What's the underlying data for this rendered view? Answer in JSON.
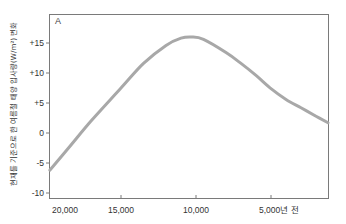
{
  "chart_data": {
    "type": "line",
    "title": "",
    "panel_label": "A",
    "xlabel": "",
    "ylabel": "현재를 기준으로 한 여름철 태양 입사량(W/m²) 변화",
    "x_unit_suffix": "년 전",
    "x_reversed": true,
    "xlim": [
      20200,
      1200
    ],
    "ylim": [
      -10.5,
      19.5
    ],
    "grid": false,
    "legend": null,
    "x_ticks": [
      20000,
      15000,
      10000,
      5000
    ],
    "x_tick_labels": [
      "20,000",
      "15,000",
      "10,000",
      "5,000년 전"
    ],
    "y_ticks": [
      15,
      10,
      5,
      0,
      -5,
      -10
    ],
    "y_tick_labels": [
      "+15",
      "+10",
      "+5",
      "0",
      "-5",
      "-10"
    ],
    "series": [
      {
        "name": "여름철 태양 입사량 변화",
        "color": "#a8a8a8",
        "x": [
          19750,
          18500,
          17000,
          15000,
          13500,
          12000,
          11000,
          10300,
          9500,
          8000,
          7000,
          6000,
          5000,
          4000,
          3000,
          2000,
          1200
        ],
        "values": [
          -6.2,
          -2.5,
          2.0,
          7.5,
          11.6,
          14.6,
          15.8,
          16.0,
          15.6,
          13.4,
          11.6,
          9.6,
          7.4,
          5.6,
          4.2,
          2.8,
          1.7
        ]
      }
    ]
  },
  "colors": {
    "curve": "#a8a8a8",
    "frame": "#7a7a7a",
    "text": "#333333"
  }
}
